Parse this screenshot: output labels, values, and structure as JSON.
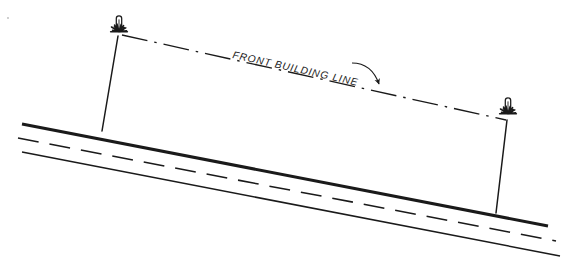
{
  "diagram": {
    "title": "FRONT BUILDING LINE",
    "type": "survey-plat-elevation-sketch",
    "background_color": "#ffffff",
    "ink_color": "#1a1a1a",
    "labels": {
      "front_building_line": "FRONT BUILDING LINE"
    },
    "elements": {
      "road": {
        "name": "street-right-of-way",
        "near_edge_label": "near-pavement-edge",
        "far_edge_label": "far-pavement-edge",
        "centerline_label": "road-centerline"
      },
      "left_monument": {
        "name": "left-survey-monument",
        "description": "iron-pipe-monument-with-grass-tuft"
      },
      "right_monument": {
        "name": "right-survey-monument",
        "description": "iron-pipe-monument-with-grass-tuft"
      },
      "left_lot_line": {
        "name": "left-side-lot-line"
      },
      "right_lot_line": {
        "name": "right-side-lot-line"
      },
      "building_line": {
        "name": "front-building-setback-line",
        "style": "dash-dot"
      },
      "leader": {
        "name": "leader-arrow",
        "points_to": "front-building-setback-line"
      }
    },
    "geometry": {
      "road_far_edge": {
        "x1": 22,
        "y1": 124,
        "x2": 548,
        "y2": 226
      },
      "road_centerline": {
        "x1": 18,
        "y1": 138,
        "x2": 556,
        "y2": 241
      },
      "road_near_edge": {
        "x1": 22,
        "y1": 152,
        "x2": 560,
        "y2": 256
      },
      "left_lot_line": {
        "x1": 118,
        "y1": 36,
        "x2": 102,
        "y2": 131
      },
      "right_lot_line": {
        "x1": 507,
        "y1": 120,
        "x2": 496,
        "y2": 213
      },
      "building_line": {
        "x1": 122,
        "y1": 35,
        "x2": 506,
        "y2": 120
      },
      "left_monument_pos": {
        "x": 119,
        "y": 30
      },
      "right_monument_pos": {
        "x": 508,
        "y": 112
      },
      "label_anchor": {
        "x": 232,
        "y": 58
      },
      "label_rotation_deg": 12.5
    }
  }
}
